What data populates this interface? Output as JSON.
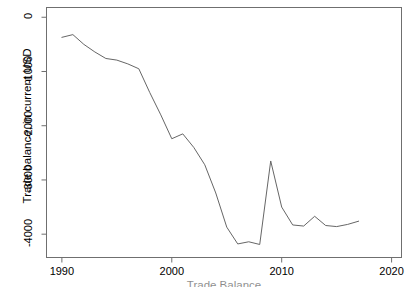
{
  "chart_data": {
    "type": "line",
    "title": "",
    "subtitle": "",
    "xlabel": "Trade Balance",
    "ylabel": "Trade balance, in current USD",
    "xlim": [
      1988.6,
      2020.9
    ],
    "ylim": [
      -4430,
      180
    ],
    "xticks": [
      1990,
      2000,
      2010,
      2020
    ],
    "xtick_labels": [
      "1990",
      "2000",
      "2010",
      "2020"
    ],
    "yticks": [
      0,
      -1000,
      -2000,
      -3000,
      -4000
    ],
    "ytick_labels": [
      "0",
      "-1000",
      "-2000",
      "-3000",
      "-4000"
    ],
    "grid": false,
    "legend": false,
    "legend_position": "none",
    "line_color": "#666666",
    "line_width": 1,
    "series": [
      {
        "name": "Trade balance",
        "x": [
          1990,
          1991,
          1992,
          1993,
          1994,
          1995,
          1996,
          1997,
          1998,
          1999,
          2000,
          2001,
          2002,
          2003,
          2004,
          2005,
          2006,
          2007,
          2008,
          2009,
          2010,
          2011,
          2012,
          2013,
          2014,
          2015,
          2016,
          2017
        ],
        "values": [
          -370,
          -320,
          -500,
          -640,
          -760,
          -790,
          -860,
          -950,
          -1390,
          -1800,
          -2240,
          -2150,
          -2400,
          -2720,
          -3240,
          -3870,
          -4180,
          -4140,
          -4190,
          -2650,
          -3500,
          -3830,
          -3850,
          -3670,
          -3840,
          -3860,
          -3820,
          -3760
        ]
      }
    ]
  },
  "axes": {
    "x_axis_name": "year-axis",
    "y_axis_name": "trade-balance-axis"
  }
}
